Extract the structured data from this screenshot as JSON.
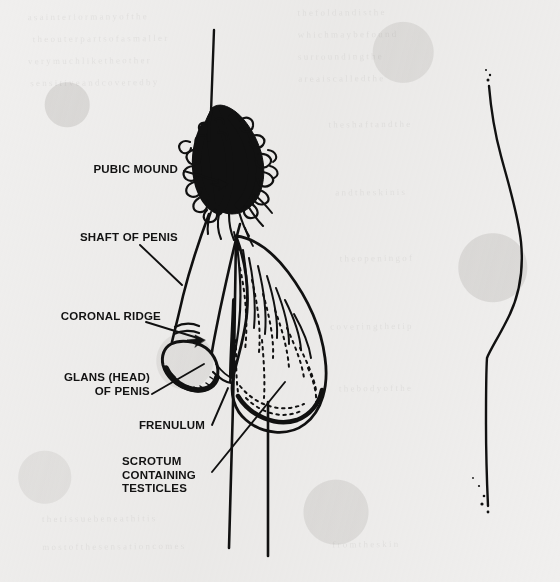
{
  "figure": {
    "kind": "anatomical-line-diagram",
    "media": "black ink line art on scanned off-white paper",
    "background_color": "#f0efee",
    "ink_color": "#111111",
    "width": 560,
    "height": 582
  },
  "labels": [
    {
      "id": "pubic-mound",
      "text": "PUBIC MOUND",
      "align": "right",
      "x": 18,
      "y": 163,
      "width": 160,
      "leader": {
        "type": "arrow",
        "x1": 184,
        "y1": 171,
        "x2": 228,
        "y2": 184
      }
    },
    {
      "id": "shaft-of-penis",
      "text": "SHAFT OF PENIS",
      "align": "right",
      "x": 8,
      "y": 231,
      "width": 170,
      "leader": {
        "type": "line",
        "x1": 140,
        "y1": 245,
        "x2": 182,
        "y2": 285
      }
    },
    {
      "id": "coronal-ridge",
      "text": "CORONAL RIDGE",
      "align": "right",
      "x": 6,
      "y": 310,
      "width": 155,
      "leader": {
        "type": "arrow",
        "x1": 146,
        "y1": 322,
        "x2": 205,
        "y2": 340
      }
    },
    {
      "id": "glans-head-of-penis",
      "text": "GLANS (HEAD)\nOF PENIS",
      "align": "right",
      "x": 10,
      "y": 371,
      "width": 140,
      "leader": {
        "type": "line",
        "x1": 152,
        "y1": 394,
        "x2": 204,
        "y2": 364
      }
    },
    {
      "id": "frenulum",
      "text": "FRENULUM",
      "align": "right",
      "x": 70,
      "y": 419,
      "width": 135,
      "leader": {
        "type": "line",
        "x1": 212,
        "y1": 425,
        "x2": 228,
        "y2": 388
      }
    },
    {
      "id": "scrotum-containing-testicles",
      "text": "SCROTUM\nCONTAINING\nTESTICLES",
      "align": "left",
      "x": 122,
      "y": 455,
      "width": 150,
      "leader": {
        "type": "line",
        "x1": 212,
        "y1": 472,
        "x2": 285,
        "y2": 382
      }
    }
  ],
  "drawing_parts": [
    {
      "id": "abdomen-midline",
      "description": "thin vertical line descending from top of frame into pubic hair"
    },
    {
      "id": "pubic-hair",
      "description": "dense curly tuft of pubic hair above the penis"
    },
    {
      "id": "penis-shaft",
      "description": "downward-angled shaft outline"
    },
    {
      "id": "coronal-ridge-mark",
      "description": "short curved ridge lines at base of glans"
    },
    {
      "id": "glans",
      "description": "rounded head of penis, outlined with stipple shading"
    },
    {
      "id": "frenulum-mark",
      "description": "small fold line under the glans"
    },
    {
      "id": "scrotum",
      "description": "pear/teardrop sac with hatched and stippled shading"
    },
    {
      "id": "thigh-line-left",
      "description": "long leg contour line at left of scrotum"
    },
    {
      "id": "thigh-line-right",
      "description": "long leg contour line at right of scrotum"
    },
    {
      "id": "body-profile-contour",
      "description": "separate curved back/buttock profile line at right of the page"
    }
  ]
}
